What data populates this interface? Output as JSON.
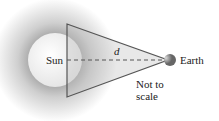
{
  "diagram": {
    "labels": {
      "sun": "Sun",
      "earth": "Earth",
      "distance": "d",
      "note_line1": "Not to",
      "note_line2": "scale"
    },
    "colors": {
      "glow": "#c8c8c8",
      "sun_fill": "#f4f4f4",
      "lines": "#555555"
    }
  }
}
